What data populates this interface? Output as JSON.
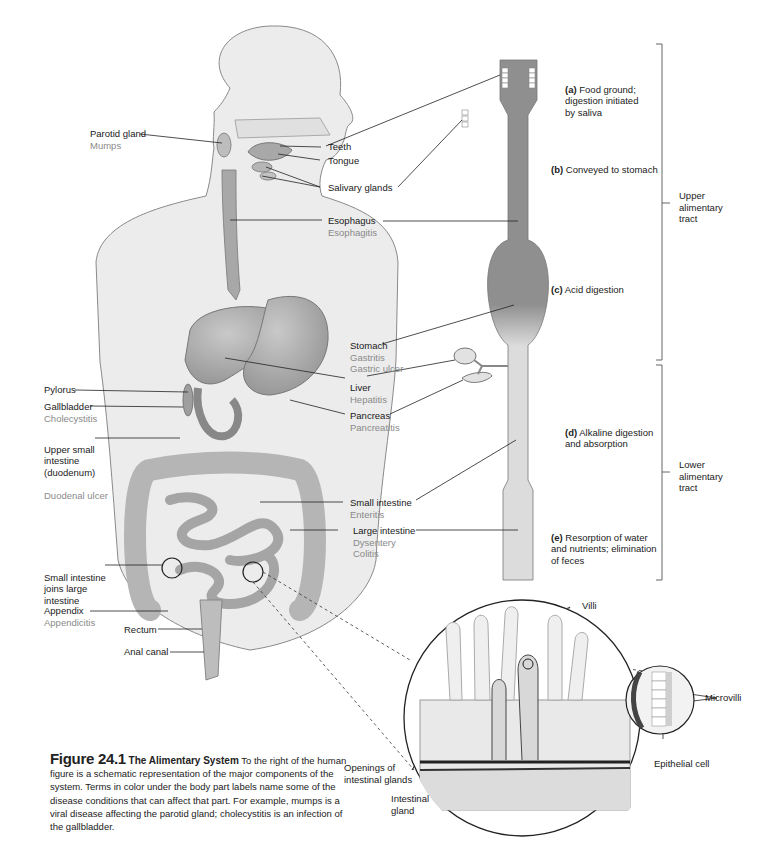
{
  "figure": {
    "number": "Figure 24.1",
    "title": "The Alimentary System",
    "caption": "To the right of the human figure is a schematic representation of the major components of the system. Terms in color under the body part labels name some of the disease conditions that can affect that part. For example, mumps is a viral disease affecting the parotid gland; cholecystitis is an infection of the gallbladder."
  },
  "labels_left": [
    {
      "id": "parotid",
      "name": "Parotid gland",
      "disease": [
        "Mumps"
      ]
    },
    {
      "id": "pylorus",
      "name": "Pylorus",
      "disease": []
    },
    {
      "id": "gallbladder",
      "name": "Gallbladder",
      "disease": [
        "Cholecystitis"
      ]
    },
    {
      "id": "duodenum",
      "name": "Upper small\nintestine\n(duodenum)",
      "disease": [
        "Duodenal ulcer"
      ]
    },
    {
      "id": "junction",
      "name": "Small intestine\njoins large\nintestine",
      "disease": []
    },
    {
      "id": "appendix",
      "name": "Appendix",
      "disease": [
        "Appendicitis"
      ]
    },
    {
      "id": "rectum",
      "name": "Rectum",
      "disease": []
    },
    {
      "id": "anal",
      "name": "Anal canal",
      "disease": []
    }
  ],
  "labels_mid": [
    {
      "id": "teeth",
      "name": "Teeth",
      "disease": []
    },
    {
      "id": "tongue",
      "name": "Tongue",
      "disease": []
    },
    {
      "id": "salivary",
      "name": "Salivary glands",
      "disease": []
    },
    {
      "id": "esophagus",
      "name": "Esophagus",
      "disease": [
        "Esophagitis"
      ]
    },
    {
      "id": "stomach",
      "name": "Stomach",
      "disease": [
        "Gastritis",
        "Gastric ulcer"
      ]
    },
    {
      "id": "liver",
      "name": "Liver",
      "disease": [
        "Hepatitis"
      ]
    },
    {
      "id": "pancreas",
      "name": "Pancreas",
      "disease": [
        "Pancreatitis"
      ]
    },
    {
      "id": "smallint",
      "name": "Small intestine",
      "disease": [
        "Enteritis"
      ]
    },
    {
      "id": "largeint",
      "name": "Large intestine",
      "disease": [
        "Dysentery",
        "Colitis"
      ]
    }
  ],
  "stages": [
    {
      "key": "(a)",
      "text": "Food ground;\ndigestion initiated\nby saliva"
    },
    {
      "key": "(b)",
      "text": "Conveyed to stomach"
    },
    {
      "key": "(c)",
      "text": "Acid digestion"
    },
    {
      "key": "(d)",
      "text": "Alkaline digestion\nand absorption"
    },
    {
      "key": "(e)",
      "text": "Resorption of water\nand nutrients; elimination\nof feces"
    }
  ],
  "tracts": [
    {
      "id": "upper",
      "text": "Upper\nalimentary\ntract"
    },
    {
      "id": "lower",
      "text": "Lower\nalimentary\ntract"
    }
  ],
  "detail_labels": {
    "villi": "Villi",
    "microvilli": "Microvilli",
    "epithelial": "Epithelial cell",
    "openings": "Openings of\nintestinal glands",
    "gland": "Intestinal\ngland"
  },
  "colors": {
    "disease_text": "#8a8a8a",
    "body_fill": "#ececec",
    "organ_fill": "#b4b4b4",
    "tract_dark": "#8f8f8f",
    "tract_light": "#dadada"
  }
}
